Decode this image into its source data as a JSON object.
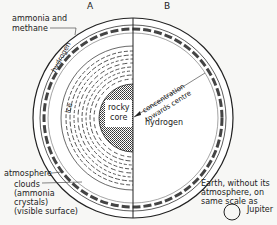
{
  "diagram": {
    "section_labels": {
      "a": "A",
      "b": "B"
    },
    "labels": {
      "ammonia_methane_1": "ammonia and",
      "ammonia_methane_2": "methane",
      "hydrogen_outer": "hydrogen",
      "ice": "ice",
      "rocky_1": "rocky",
      "rocky_2": "core",
      "hydrogen_inner": "hydrogen",
      "concentration_1": "concentration",
      "concentration_2": "towards centre",
      "atmosphere": "atmosphere",
      "clouds_1": "clouds",
      "clouds_2": "(ammonia",
      "clouds_3": "crystals)",
      "clouds_4": "(visible surface)",
      "earth_1": "Earth, without its",
      "earth_2": "atmosphere, on",
      "earth_3": "same scale as",
      "earth_4": "Jupiter"
    }
  }
}
